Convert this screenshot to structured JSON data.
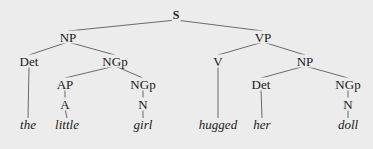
{
  "diagram": {
    "type": "syntax-tree",
    "nodes": {
      "s": {
        "label": "S",
        "x": 176,
        "y": 15
      },
      "np1": {
        "label": "NP",
        "x": 68,
        "y": 37
      },
      "vp": {
        "label": "VP",
        "x": 263,
        "y": 37
      },
      "det1": {
        "label": "Det",
        "x": 29,
        "y": 61
      },
      "ngp1": {
        "label": "NGp",
        "x": 115,
        "y": 61
      },
      "v": {
        "label": "V",
        "x": 218,
        "y": 61
      },
      "np2": {
        "label": "NP",
        "x": 305,
        "y": 61
      },
      "ap": {
        "label": "AP",
        "x": 65,
        "y": 84
      },
      "ngp2": {
        "label": "NGp",
        "x": 143,
        "y": 84
      },
      "det2": {
        "label": "Det",
        "x": 261,
        "y": 84
      },
      "ngp3": {
        "label": "NGp",
        "x": 348,
        "y": 84
      },
      "a": {
        "label": "A",
        "x": 65,
        "y": 104
      },
      "n1": {
        "label": "N",
        "x": 143,
        "y": 104
      },
      "n2": {
        "label": "N",
        "x": 348,
        "y": 104
      },
      "w_the": {
        "label": "the",
        "x": 28,
        "y": 124
      },
      "w_little": {
        "label": "little",
        "x": 67,
        "y": 124
      },
      "w_girl": {
        "label": "girl",
        "x": 143,
        "y": 124
      },
      "w_hugged": {
        "label": "hugged",
        "x": 218,
        "y": 124
      },
      "w_her": {
        "label": "her",
        "x": 262,
        "y": 124
      },
      "w_doll": {
        "label": "doll",
        "x": 348,
        "y": 124
      }
    },
    "edges": [
      [
        "s",
        "np1"
      ],
      [
        "s",
        "vp"
      ],
      [
        "np1",
        "det1"
      ],
      [
        "np1",
        "ngp1"
      ],
      [
        "ngp1",
        "ap"
      ],
      [
        "ngp1",
        "ngp2"
      ],
      [
        "ap",
        "a"
      ],
      [
        "a",
        "w_little"
      ],
      [
        "ngp2",
        "n1"
      ],
      [
        "n1",
        "w_girl"
      ],
      [
        "det1",
        "w_the"
      ],
      [
        "vp",
        "v"
      ],
      [
        "vp",
        "np2"
      ],
      [
        "v",
        "w_hugged"
      ],
      [
        "np2",
        "det2"
      ],
      [
        "np2",
        "ngp3"
      ],
      [
        "det2",
        "w_her"
      ],
      [
        "ngp3",
        "n2"
      ],
      [
        "n2",
        "w_doll"
      ]
    ],
    "sentence": "the little girl hugged her doll",
    "colors": {
      "background": "#ececec",
      "line": "#6a6a6a",
      "text": "#1a1a1a"
    }
  }
}
